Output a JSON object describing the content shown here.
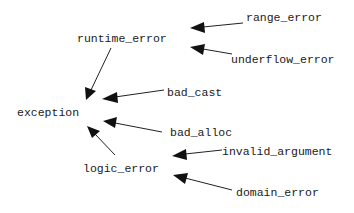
{
  "diagram": {
    "title": "",
    "type": "class hierarchy",
    "nodes": {
      "exception": "exception",
      "runtime_error": "runtime_error",
      "logic_error": "logic_error",
      "bad_cast": "bad_cast",
      "bad_alloc": "bad_alloc",
      "range_error": "range_error",
      "underflow_error": "underflow_error",
      "invalid_argument": "invalid_argument",
      "domain_error": "domain_error"
    },
    "edges": [
      {
        "from": "runtime_error",
        "to": "exception"
      },
      {
        "from": "logic_error",
        "to": "exception"
      },
      {
        "from": "bad_cast",
        "to": "exception"
      },
      {
        "from": "bad_alloc",
        "to": "exception"
      },
      {
        "from": "range_error",
        "to": "runtime_error"
      },
      {
        "from": "underflow_error",
        "to": "runtime_error"
      },
      {
        "from": "invalid_argument",
        "to": "logic_error"
      },
      {
        "from": "domain_error",
        "to": "logic_error"
      }
    ],
    "colors": {
      "text": "#1a1a1a",
      "arrow": "#111111",
      "background": "#ffffff"
    }
  }
}
